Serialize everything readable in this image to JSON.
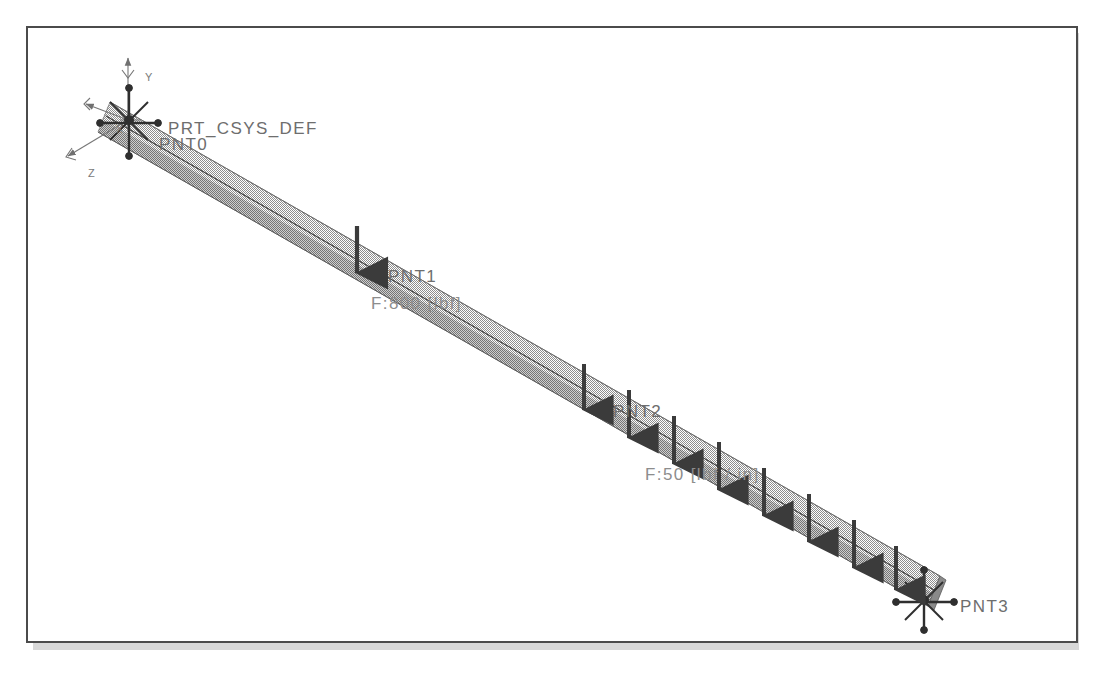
{
  "window": {
    "background_color": "#ffffff",
    "frame_color": "#4b4b4b",
    "shadow_color": "#d8d8d8"
  },
  "model": {
    "type": "beam-fea-model",
    "beam_color": "#9a9a9a",
    "beam_edge_color": "#4a4a4a",
    "annotation_color": "#6e6e6e",
    "arrow_color": "#3b3b3b",
    "csys": {
      "label": "PRT_CSYS_DEF",
      "axes": [
        {
          "name": "Y",
          "label": "Y"
        },
        {
          "name": "X",
          "label": "X"
        },
        {
          "name": "Z",
          "label": "Z"
        }
      ]
    },
    "points": [
      {
        "id": "pnt0",
        "label": "PNT0",
        "kind": "constraint"
      },
      {
        "id": "pnt1",
        "label": "PNT1",
        "kind": "load-point"
      },
      {
        "id": "pnt2",
        "label": "PNT2",
        "kind": "load-point"
      },
      {
        "id": "pnt3",
        "label": "PNT3",
        "kind": "constraint"
      }
    ],
    "loads": [
      {
        "id": "force1",
        "attached_to": "PNT1",
        "label": "F:800 [lbf]",
        "direction": "down",
        "kind": "point-force"
      },
      {
        "id": "force2",
        "attached_to": "PNT2",
        "label": "F:50 [lbf / in]",
        "direction": "down",
        "kind": "distributed-force",
        "arrow_count": 8
      }
    ]
  }
}
